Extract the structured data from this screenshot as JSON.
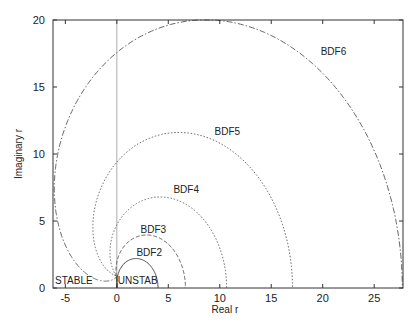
{
  "chart_data": {
    "type": "line",
    "title": "",
    "xlabel": "Real r",
    "ylabel": "Imaginary r",
    "xlim": [
      -6.2,
      27.8
    ],
    "ylim": [
      0,
      20
    ],
    "x_ticks": [
      -5,
      0,
      5,
      10,
      15,
      20,
      25
    ],
    "y_ticks": [
      0,
      5,
      10,
      15,
      20
    ],
    "grid": false,
    "legend": "none (inline curve labels)",
    "vertical_reference_line_x": 0,
    "region_labels": [
      {
        "text": "STABLE",
        "x": -6.0,
        "y": 0.15
      },
      {
        "text": "UNSTAB",
        "x": 0.1,
        "y": 0.15
      }
    ],
    "series": [
      {
        "name": "BDF2",
        "order": 2,
        "style": "solid",
        "label_pos": [
          1.9,
          2.4
        ],
        "max_real": 4.0,
        "max_imag": 2.1
      },
      {
        "name": "BDF3",
        "order": 3,
        "style": "dashed",
        "label_pos": [
          2.3,
          4.1
        ],
        "max_real": 6.7,
        "max_imag": 3.9
      },
      {
        "name": "BDF4",
        "order": 4,
        "style": "dotted",
        "label_pos": [
          5.5,
          7.1
        ],
        "max_real": 10.7,
        "max_imag": 7.0
      },
      {
        "name": "BDF5",
        "order": 5,
        "style": "dotted",
        "label_pos": [
          9.5,
          11.4
        ],
        "max_real": 17.0,
        "max_imag": 11.5
      },
      {
        "name": "BDF6",
        "order": 6,
        "style": "dashdot",
        "label_pos": [
          19.8,
          17.4
        ],
        "max_real": 27.6,
        "max_imag": 19.9
      }
    ]
  }
}
